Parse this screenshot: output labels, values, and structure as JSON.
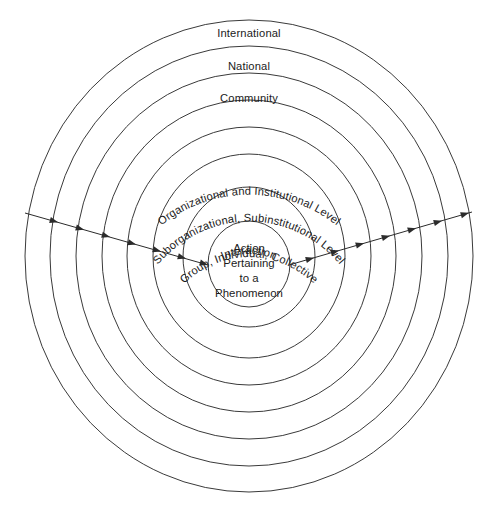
{
  "diagram": {
    "type": "concentric-circles",
    "background_color": "#ffffff",
    "stroke_color": "#3a3a3a",
    "text_color": "#1b1b1b",
    "center": {
      "x": 249,
      "y": 256
    },
    "rings": [
      {
        "index": 1,
        "label": "International",
        "rx": 224,
        "ry": 236,
        "label_style": "horizontal"
      },
      {
        "index": 2,
        "label": "National",
        "rx": 199,
        "ry": 210,
        "label_style": "horizontal"
      },
      {
        "index": 3,
        "label": "Community",
        "rx": 173,
        "ry": 183,
        "label_style": "horizontal"
      },
      {
        "index": 4,
        "label": "Organizational and Institutional Level",
        "rx": 147,
        "ry": 156,
        "label_style": "curved"
      },
      {
        "index": 5,
        "label": "Suborganizational, Subinstitutional Level",
        "rx": 122,
        "ry": 129,
        "label_style": "curved"
      },
      {
        "index": 6,
        "label": "Group, Individual, Collective",
        "rx": 96,
        "ry": 102,
        "label_style": "curved"
      },
      {
        "index": 7,
        "label": "Interaction",
        "rx": 66,
        "ry": 70,
        "label_style": "curved"
      },
      {
        "index": 8,
        "label": "",
        "rx": 41,
        "ry": 43,
        "label_style": "none"
      }
    ],
    "core": {
      "lines": [
        "Action",
        "Pertaining",
        "to a",
        "Phenomenon"
      ]
    },
    "flows": [
      {
        "name": "inbound-flow-left",
        "direction": "left-to-center",
        "start": {
          "x": 25,
          "y": 213
        },
        "end": {
          "x": 208,
          "y": 265
        },
        "arrowhead_count": 7
      },
      {
        "name": "outbound-flow-right",
        "direction": "center-to-right",
        "start": {
          "x": 289,
          "y": 265
        },
        "end": {
          "x": 472,
          "y": 212
        },
        "arrowhead_count": 7
      }
    ]
  }
}
